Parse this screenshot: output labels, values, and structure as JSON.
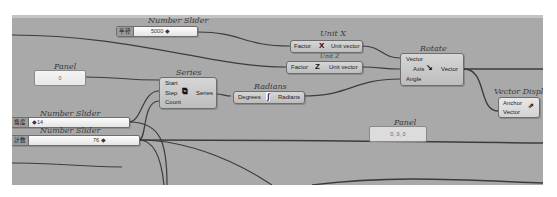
{
  "canvas": {
    "background": "#a9a9a9",
    "wire_color": "#3c3c3c"
  },
  "components": {
    "slider_top": {
      "title": "Number Slider",
      "label": "半径",
      "value": "5000 ◆"
    },
    "unit_x": {
      "title": "Unit X",
      "input": "Factor",
      "output": "Unit vector",
      "icon": "X"
    },
    "unit_z": {
      "title": "Unit Z",
      "input": "Factor",
      "output": "Unit vector",
      "icon": "Z"
    },
    "rotate": {
      "title": "Rotate",
      "inputs": [
        "Vector",
        "Axis",
        "Angle"
      ],
      "output": "Vector"
    },
    "panel_left": {
      "title": "Panel",
      "content": "0"
    },
    "series": {
      "title": "Series",
      "inputs": [
        "Start",
        "Step",
        "Count"
      ],
      "output": "Series"
    },
    "radians": {
      "title": "Radians",
      "input": "Degrees",
      "output": "Radians"
    },
    "vector_display": {
      "title": "Vector Display",
      "inputs": [
        "Anchor",
        "Vector"
      ]
    },
    "panel_right": {
      "title": "Panel",
      "content": "0, 0, 0"
    },
    "slider_angle": {
      "title": "Number Slider",
      "label": "角度",
      "value": "◆14"
    },
    "slider_count": {
      "title": "Number Slider",
      "label": "計数",
      "value": "76 ◆"
    }
  }
}
